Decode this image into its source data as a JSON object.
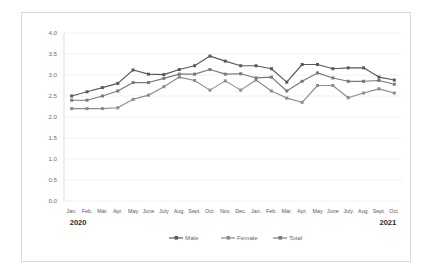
{
  "chart_data": {
    "type": "line",
    "title": "",
    "subtitle": "",
    "xlabel": "",
    "ylabel": "",
    "ylim": [
      0.0,
      4.0
    ],
    "ytick_labels": [
      "0.0",
      "0.5",
      "1.0",
      "1.5",
      "2.0",
      "2.5",
      "3.0",
      "3.5",
      "4.0"
    ],
    "ytick_values": [
      0.0,
      0.5,
      1.0,
      1.5,
      2.0,
      2.5,
      3.0,
      3.5,
      4.0
    ],
    "grid": true,
    "legend_position": "bottom-center",
    "categories": [
      "Jan.",
      "Feb.",
      "Mar.",
      "Apr.",
      "May",
      "June",
      "July",
      "Aug.",
      "Sept.",
      "Oct.",
      "Nov.",
      "Dec.",
      "Jan.",
      "Feb.",
      "Mar.",
      "Apr.",
      "May",
      "June",
      "July",
      "Aug.",
      "Sept.",
      "Oct."
    ],
    "group_labels": [
      {
        "label": "2020",
        "start_index": 0,
        "end_index": 11
      },
      {
        "label": "2021",
        "start_index": 12,
        "end_index": 21
      }
    ],
    "series": [
      {
        "name": "Male",
        "color": "#595959",
        "values": [
          2.5,
          2.6,
          2.7,
          2.8,
          3.12,
          3.02,
          3.01,
          3.13,
          3.22,
          3.45,
          3.33,
          3.22,
          3.22,
          3.15,
          2.83,
          3.25,
          3.25,
          3.15,
          3.17,
          3.17,
          2.95,
          2.88
        ]
      },
      {
        "name": "Female",
        "color": "#8c8c8c",
        "values": [
          2.2,
          2.2,
          2.2,
          2.22,
          2.42,
          2.52,
          2.72,
          2.95,
          2.87,
          2.64,
          2.86,
          2.64,
          2.88,
          2.62,
          2.45,
          2.35,
          2.75,
          2.75,
          2.46,
          2.57,
          2.67,
          2.57
        ]
      },
      {
        "name": "Total",
        "color": "#787878",
        "values": [
          2.4,
          2.4,
          2.5,
          2.62,
          2.82,
          2.82,
          2.92,
          3.02,
          3.02,
          3.13,
          3.02,
          3.03,
          2.93,
          2.95,
          2.62,
          2.85,
          3.05,
          2.93,
          2.85,
          2.85,
          2.87,
          2.78
        ]
      }
    ]
  },
  "legend": {
    "items": [
      {
        "label": "Male",
        "color": "#595959"
      },
      {
        "label": "Female",
        "color": "#8c8c8c"
      },
      {
        "label": "Total",
        "color": "#787878"
      }
    ]
  }
}
